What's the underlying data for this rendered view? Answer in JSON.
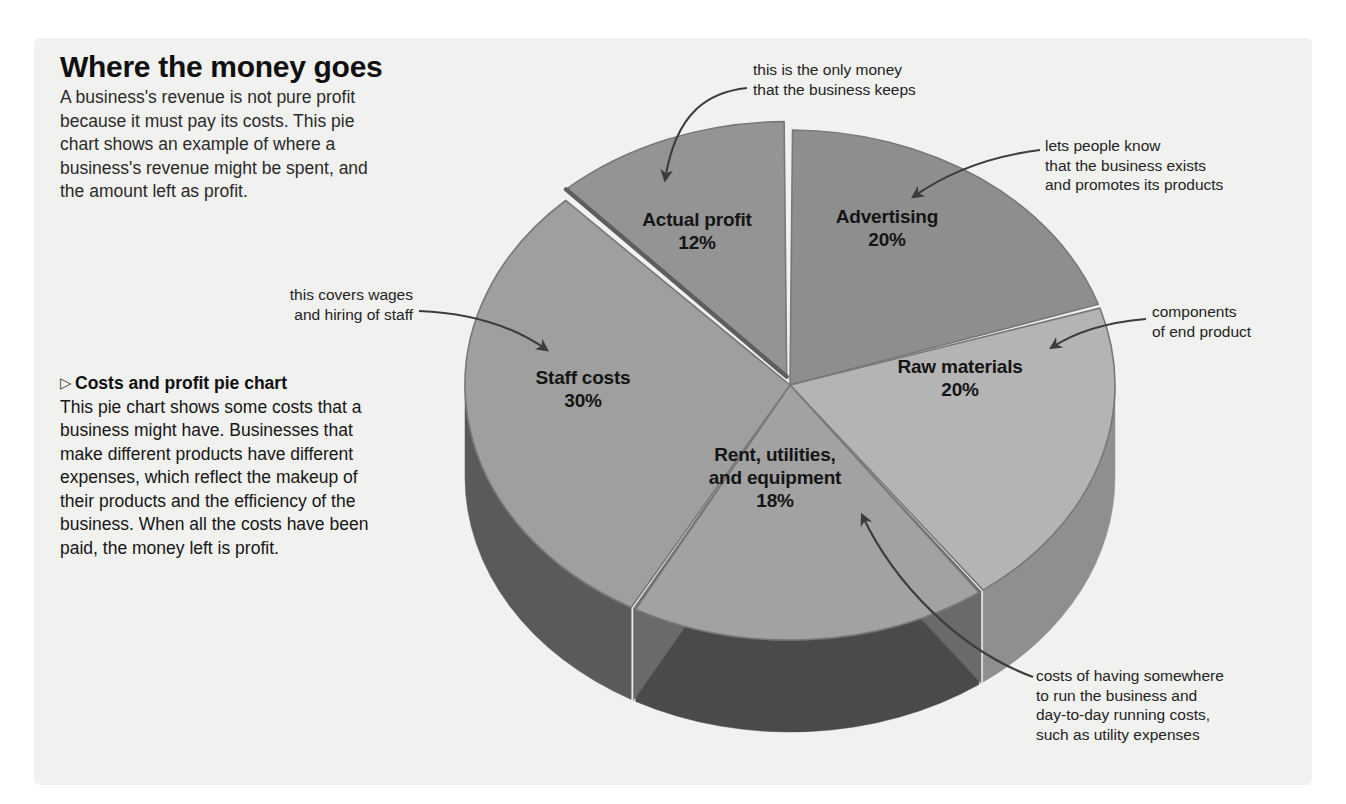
{
  "panel": {
    "background": "#f1f1ef"
  },
  "heading": {
    "title": "Where the money goes",
    "intro": "A business's revenue is not pure profit because it must pay its costs. This pie chart shows an example of where a business's revenue might be spent, and the amount left as profit."
  },
  "caption": {
    "marker": "▷",
    "head": "Costs and profit pie chart",
    "body": "This pie chart shows some costs that a business might have. Businesses that make different products have different expenses, which reflect the makeup of their products and the efficiency of the business. When all the costs have been paid, the money left is profit."
  },
  "annotations": [
    {
      "name": "annotation-actual-profit",
      "text": "this is the only money\nthat the business keeps"
    },
    {
      "name": "annotation-advertising",
      "text": "lets people know\nthat the business exists\nand promotes its products"
    },
    {
      "name": "annotation-raw-materials",
      "text": "components\nof end product"
    },
    {
      "name": "annotation-rent-utilities",
      "text": "costs of having somewhere\nto run the business and\nday-to-day running costs,\nsuch as utility expenses"
    },
    {
      "name": "annotation-staff-costs",
      "text": "this covers wages\nand hiring of staff"
    }
  ],
  "chart_data": {
    "type": "pie",
    "title": "Where the money goes",
    "subtitle": "Costs and profit pie chart",
    "unit": "%",
    "total": 100,
    "three_d": true,
    "legend": "none (labels drawn on slices)",
    "categories": [
      "Advertising",
      "Raw materials",
      "Rent, utilities, and equipment",
      "Staff costs",
      "Actual profit"
    ],
    "values": [
      20,
      20,
      18,
      30,
      12
    ],
    "labels": [
      {
        "name": "Advertising",
        "value": 20,
        "value_text": "20%",
        "color": "#8e8e8e",
        "side_color": "#6f6f6f"
      },
      {
        "name": "Raw materials",
        "value": 20,
        "value_text": "20%",
        "color": "#b4b4b4",
        "side_color": "#8f8f8f"
      },
      {
        "name": "Rent, utilities, and equipment",
        "value": 18,
        "value_text": "18%",
        "color": "#a2a2a2",
        "side_color": "#4a4a4a"
      },
      {
        "name": "Staff costs",
        "value": 30,
        "value_text": "30%",
        "color": "#9f9f9f",
        "side_color": "#5a5a5a"
      },
      {
        "name": "Actual profit",
        "value": 12,
        "value_text": "12%",
        "color": "#949494",
        "side_color": "#707070"
      }
    ],
    "slice_label_lines": {
      "advertising": [
        "Advertising",
        "20%"
      ],
      "raw_materials": [
        "Raw materials",
        "20%"
      ],
      "rent": [
        "Rent, utilities,",
        "and equipment",
        "18%"
      ],
      "staff": [
        "Staff costs",
        "30%"
      ],
      "profit": [
        "Actual profit",
        "12%"
      ]
    }
  },
  "colors": {
    "panel_bg": "#f1f1ef",
    "page_bg": "#ffffff",
    "text": "#232323",
    "heading": "#0f0f0f",
    "arrow": "#3c3c3c"
  }
}
